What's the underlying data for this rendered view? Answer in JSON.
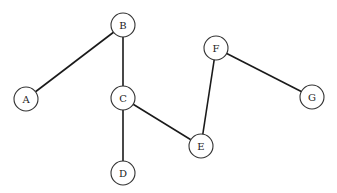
{
  "diagram": {
    "type": "undirected-graph",
    "node_radius": 12,
    "colors": {
      "background": "#ffffff",
      "edge": "#1a1a1a",
      "node_stroke": "#333333",
      "node_fill": "#ffffff",
      "label": "#222222"
    },
    "nodes": [
      {
        "id": "A",
        "label": "A",
        "x": 26,
        "y": 99
      },
      {
        "id": "B",
        "label": "B",
        "x": 123,
        "y": 25
      },
      {
        "id": "C",
        "label": "C",
        "x": 123,
        "y": 98
      },
      {
        "id": "D",
        "label": "D",
        "x": 123,
        "y": 173
      },
      {
        "id": "E",
        "label": "E",
        "x": 201,
        "y": 146
      },
      {
        "id": "F",
        "label": "F",
        "x": 216,
        "y": 48
      },
      {
        "id": "G",
        "label": "G",
        "x": 312,
        "y": 97
      }
    ],
    "edges": [
      {
        "from": "A",
        "to": "B"
      },
      {
        "from": "B",
        "to": "C"
      },
      {
        "from": "C",
        "to": "D"
      },
      {
        "from": "C",
        "to": "E"
      },
      {
        "from": "E",
        "to": "F"
      },
      {
        "from": "F",
        "to": "G"
      }
    ]
  }
}
